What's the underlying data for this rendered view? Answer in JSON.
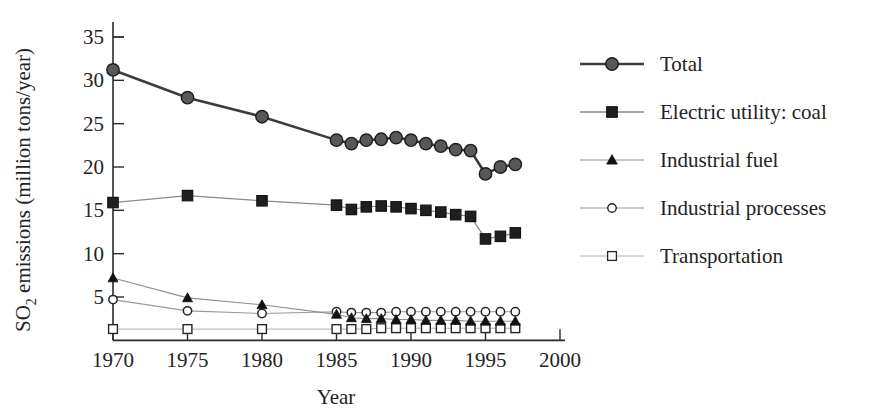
{
  "chart_data": {
    "type": "line",
    "title": "",
    "xlabel": "Year",
    "ylabel": "SO2 emissions (million tons/year)",
    "ylabel_main": "SO",
    "ylabel_sub": "2",
    "ylabel_rest": " emissions (million tons/year)",
    "xlim": [
      1969,
      2000
    ],
    "ylim": [
      0,
      36
    ],
    "grid": false,
    "legend_position": "right",
    "x_ticks": [
      1970,
      1975,
      1980,
      1985,
      1990,
      1995,
      2000
    ],
    "y_ticks": [
      5,
      10,
      15,
      20,
      25,
      30,
      35
    ],
    "x": [
      1970,
      1975,
      1980,
      1985,
      1986,
      1987,
      1988,
      1989,
      1990,
      1991,
      1992,
      1993,
      1994,
      1995,
      1996,
      1997
    ],
    "series": [
      {
        "name": "Total",
        "marker": "filled-circle",
        "color": "#585858",
        "line_color": "#3c3c3c",
        "values": [
          31.2,
          28.0,
          25.8,
          23.1,
          22.7,
          23.1,
          23.2,
          23.4,
          23.1,
          22.7,
          22.4,
          22.0,
          21.9,
          19.2,
          20.0,
          20.3
        ]
      },
      {
        "name": "Electric utility: coal",
        "marker": "filled-square",
        "color": "#1f1f1f",
        "line_color": "#8a8a8a",
        "values": [
          15.9,
          16.7,
          16.1,
          15.6,
          15.1,
          15.4,
          15.5,
          15.4,
          15.2,
          15.0,
          14.8,
          14.5,
          14.3,
          11.7,
          12.0,
          12.4
        ]
      },
      {
        "name": "Industrial fuel",
        "marker": "filled-triangle",
        "color": "#121212",
        "line_color": "#8f8f8f",
        "values": [
          7.2,
          4.9,
          4.1,
          3.0,
          2.6,
          2.5,
          2.5,
          2.4,
          2.4,
          2.3,
          2.3,
          2.3,
          2.2,
          2.2,
          2.2,
          2.2
        ]
      },
      {
        "name": "Industrial processes",
        "marker": "open-circle",
        "color": "#ffffff",
        "line_color": "#9a9a9a",
        "values": [
          4.7,
          3.4,
          3.1,
          3.3,
          3.2,
          3.2,
          3.2,
          3.3,
          3.3,
          3.3,
          3.3,
          3.3,
          3.3,
          3.3,
          3.3,
          3.3
        ]
      },
      {
        "name": "Transportation",
        "marker": "open-square",
        "color": "#ffffff",
        "line_color": "#b0b0b0",
        "values": [
          1.3,
          1.3,
          1.3,
          1.3,
          1.3,
          1.3,
          1.4,
          1.4,
          1.4,
          1.4,
          1.4,
          1.4,
          1.4,
          1.4,
          1.4,
          1.4
        ]
      }
    ]
  },
  "legend": {
    "items": [
      {
        "label": "Total",
        "marker": "filled-circle"
      },
      {
        "label": "Electric utility: coal",
        "marker": "filled-square"
      },
      {
        "label": "Industrial fuel",
        "marker": "filled-triangle"
      },
      {
        "label": "Industrial processes",
        "marker": "open-circle"
      },
      {
        "label": "Transportation",
        "marker": "open-square"
      }
    ]
  },
  "colors": {
    "axis": "#2b2b2b",
    "text": "#232323",
    "total": "#585858",
    "coal": "#1f1f1f",
    "fuel": "#121212",
    "processes": "#ffffff",
    "transportation": "#ffffff",
    "background": "#ffffff"
  }
}
